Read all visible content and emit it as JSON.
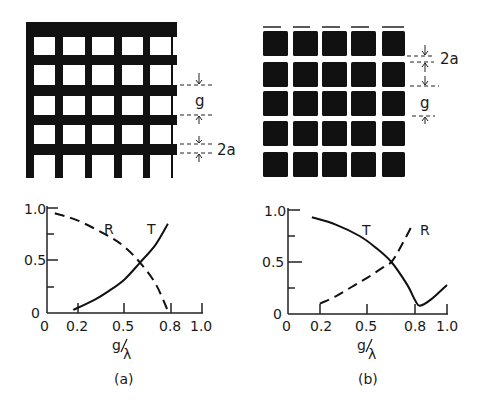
{
  "figure": {
    "panels": [
      {
        "id": "a",
        "caption": "(a)",
        "structure": "metal mesh (inductive grid)",
        "dim_labels": {
          "gap": "g",
          "width": "2a"
        }
      },
      {
        "id": "b",
        "caption": "(b)",
        "structure": "array of metal squares (capacitive grid)",
        "dim_labels": {
          "gap": "g",
          "width": "2a"
        }
      }
    ],
    "axis": {
      "xlabel_num": "g",
      "xlabel_den": "λ",
      "x_ticks": [
        "0",
        "0.2",
        "0.5",
        "0.8",
        "1.0"
      ],
      "y_ticks": [
        "0",
        "0.5",
        "1.0"
      ]
    },
    "curve_labels": {
      "R": "R",
      "T": "T"
    }
  },
  "chart_data": [
    {
      "type": "line",
      "title": "(a)",
      "xlabel": "g/λ",
      "ylabel": "",
      "xlim": [
        0,
        1.0
      ],
      "ylim": [
        0,
        1.0
      ],
      "x_ticks": [
        0,
        0.2,
        0.5,
        0.8,
        1.0
      ],
      "y_ticks": [
        0,
        0.5,
        1.0
      ],
      "grid": false,
      "legend": "inline labels",
      "series": [
        {
          "name": "R",
          "style": "dashed",
          "x": [
            0.05,
            0.2,
            0.4,
            0.5,
            0.6,
            0.7,
            0.78
          ],
          "y": [
            0.95,
            0.88,
            0.73,
            0.63,
            0.48,
            0.28,
            0.02
          ]
        },
        {
          "name": "T",
          "style": "solid",
          "x": [
            0.17,
            0.3,
            0.4,
            0.5,
            0.6,
            0.7,
            0.78
          ],
          "y": [
            0.03,
            0.12,
            0.21,
            0.32,
            0.48,
            0.65,
            0.85
          ]
        }
      ]
    },
    {
      "type": "line",
      "title": "(b)",
      "xlabel": "g/λ",
      "ylabel": "",
      "xlim": [
        0,
        1.0
      ],
      "ylim": [
        0,
        1.0
      ],
      "x_ticks": [
        0,
        0.2,
        0.5,
        0.8,
        1.0
      ],
      "y_ticks": [
        0,
        0.5,
        1.0
      ],
      "grid": false,
      "legend": "inline labels",
      "series": [
        {
          "name": "T",
          "style": "solid",
          "x": [
            0.15,
            0.3,
            0.45,
            0.55,
            0.65,
            0.75,
            0.8,
            0.83,
            0.9,
            1.0
          ],
          "y": [
            0.93,
            0.86,
            0.75,
            0.64,
            0.5,
            0.28,
            0.13,
            0.08,
            0.14,
            0.28
          ]
        },
        {
          "name": "R",
          "style": "dashed",
          "x": [
            0.2,
            0.3,
            0.4,
            0.5,
            0.6,
            0.65,
            0.7,
            0.78
          ],
          "y": [
            0.1,
            0.17,
            0.26,
            0.35,
            0.45,
            0.5,
            0.62,
            0.85
          ]
        }
      ]
    }
  ]
}
